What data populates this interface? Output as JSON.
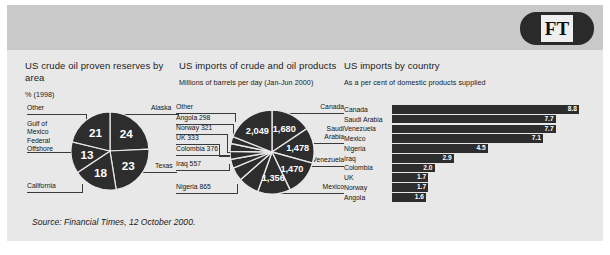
{
  "brand": {
    "logo_text": "FT",
    "logo_name": "financial-times-logo"
  },
  "source": {
    "prefix": "Source: ",
    "publication": "Financial Times",
    "suffix": ", 12 October 2000."
  },
  "colors": {
    "panel_bg": "#e8e8e8",
    "band_bg": "#c9c9c9",
    "ink": "#2d2d2d",
    "text": "#141414"
  },
  "panel1": {
    "title": "US crude oil proven reserves by area",
    "subtitle": "% (1998)",
    "labels": {
      "other": "Other",
      "gulf": "Gulf of Mexico Federal Offshore",
      "california": "California",
      "alaska": "Alaska",
      "texas": "Texas"
    }
  },
  "panel2": {
    "title": "US imports of crude and oil products",
    "subtitle": "Millions of barrels per day (Jan-Jun 2000)",
    "labels": {
      "other": "Other",
      "angola": "Angola 298",
      "norway": "Norway 321",
      "uk": "UK 333",
      "colombia": "Colombia 376",
      "iraq": "Iraq 557",
      "nigeria": "Nigeria 865",
      "canada": "Canada",
      "saudi_l1": "Saudi",
      "saudi_l2": "Arabia",
      "venezuela": "Venezuela",
      "mexico": "Mexico"
    },
    "slice_values": {
      "other": "2,049",
      "canada": "1,680",
      "saudi": "1,478",
      "venezuela": "1,470",
      "mexico": "1,356"
    }
  },
  "panel3": {
    "title": "US imports by country",
    "subtitle": "As a per cent of domestic products supplied"
  },
  "chart_data": [
    {
      "type": "pie",
      "title": "US crude oil proven reserves by area",
      "subtitle": "% (1998)",
      "unit": "per cent",
      "year": 1998,
      "categories": [
        "Alaska",
        "Texas",
        "California",
        "Gulf of Mexico Federal Offshore",
        "Other"
      ],
      "values": [
        24,
        23,
        18,
        13,
        21
      ],
      "labels_shown": [
        "24",
        "23",
        "18",
        "13",
        "21"
      ],
      "legend": "callout labels around pie",
      "grid": false
    },
    {
      "type": "pie",
      "title": "US imports of crude and oil products",
      "subtitle": "Millions of barrels per day (Jan-Jun 2000)",
      "unit": "thousands of barrels per day",
      "period": "Jan-Jun 2000",
      "categories": [
        "Canada",
        "Saudi Arabia",
        "Venezuela",
        "Mexico",
        "Nigeria",
        "Iraq",
        "Colombia",
        "UK",
        "Norway",
        "Angola",
        "Other"
      ],
      "values": [
        1680,
        1478,
        1470,
        1356,
        865,
        557,
        376,
        333,
        321,
        298,
        2049
      ],
      "labels_shown": [
        "1,680",
        "1,478",
        "1,470",
        "1,356",
        "Nigeria 865",
        "Iraq 557",
        "Colombia 376",
        "UK 333",
        "Norway 321",
        "Angola 298",
        "2,049"
      ],
      "legend": "callout labels around pie",
      "grid": false
    },
    {
      "type": "bar",
      "orientation": "horizontal",
      "title": "US imports by country",
      "subtitle": "As a per cent of domestic products supplied",
      "xlabel": "",
      "ylabel": "",
      "unit": "per cent",
      "xlim": [
        0,
        8.8
      ],
      "grid": false,
      "categories": [
        "Canada",
        "Saudi Arabia",
        "Venezuela",
        "Mexico",
        "Nigeria",
        "Iraq",
        "Colombia",
        "UK",
        "Norway",
        "Angola"
      ],
      "values": [
        8.8,
        7.7,
        7.7,
        7.1,
        4.5,
        2.9,
        2.0,
        1.7,
        1.7,
        1.6
      ],
      "value_labels": [
        "8.8",
        "7.7",
        "7.7",
        "7.1",
        "4.5",
        "2.9",
        "2.0",
        "1.7",
        "1.7",
        "1.6"
      ]
    }
  ]
}
